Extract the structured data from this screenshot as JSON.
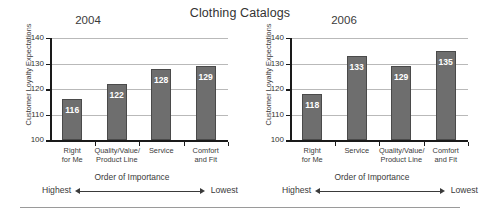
{
  "chart_data": {
    "type": "bar",
    "title": "Clothing Catalogs",
    "xlabel": "Order of Importance",
    "ylabel": "Customer Loyalty Expectations",
    "ylim": [
      100,
      140
    ],
    "yticks": [
      100,
      110,
      120,
      130,
      140
    ],
    "grid": true,
    "legend": "none",
    "order_axis": {
      "caption": "Order of Importance",
      "left_end": "Highest",
      "right_end": "Lowest"
    },
    "panels": [
      {
        "name": "2004",
        "categories": [
          "Right\nfor Me",
          "Quality/Value/\nProduct Line",
          "Service",
          "Comfort\nand Fit"
        ],
        "values": [
          116,
          122,
          128,
          129
        ]
      },
      {
        "name": "2006",
        "categories": [
          "Right\nfor Me",
          "Service",
          "Quality/Value/\nProduct Line",
          "Comfort\nand Fit"
        ],
        "values": [
          118,
          133,
          129,
          135
        ]
      }
    ],
    "colors": {
      "bar_fill": "#6e6e6e",
      "bar_border": "#4a4a4a",
      "value_label": "#ffffff",
      "gridline": "#b9b9b9",
      "axis": "#1a1a1a",
      "text": "#3a3a3a"
    }
  }
}
